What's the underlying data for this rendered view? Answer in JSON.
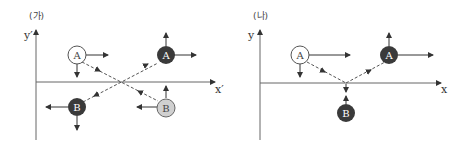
{
  "panels": [
    {
      "label": "(가)",
      "x_axis": "x′",
      "y_axis": "y′",
      "balls": [
        {
          "name": "A",
          "state": "before",
          "fill": "#ffffff",
          "text_color": "#444444"
        },
        {
          "name": "A",
          "state": "after",
          "fill": "#3a3a3a",
          "text_color": "#ffffff"
        },
        {
          "name": "B",
          "state": "before",
          "fill": "#d0d0d0",
          "text_color": "#444444"
        },
        {
          "name": "B",
          "state": "after",
          "fill": "#3a3a3a",
          "text_color": "#ffffff"
        }
      ]
    },
    {
      "label": "(나)",
      "x_axis": "x",
      "y_axis": "y",
      "balls": [
        {
          "name": "A",
          "state": "before",
          "fill": "#ffffff",
          "text_color": "#444444"
        },
        {
          "name": "A",
          "state": "after",
          "fill": "#3a3a3a",
          "text_color": "#ffffff"
        },
        {
          "name": "B",
          "state": "after",
          "fill": "#3a3a3a",
          "text_color": "#ffffff"
        }
      ]
    }
  ],
  "colors": {
    "axis": "#555555",
    "arrow": "#333333",
    "dashed": "#555555"
  }
}
